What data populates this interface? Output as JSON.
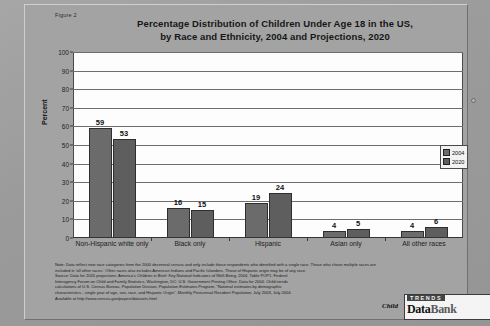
{
  "figure_label": "Figure 2",
  "legend": {
    "entries": [
      {
        "label": "2004",
        "color": "#6b6b6b"
      },
      {
        "label": "2020",
        "color": "#5e5e5e"
      }
    ]
  },
  "logo": {
    "child": "Child",
    "trends": "TRENDS",
    "data": "Data",
    "bank": "Bank"
  },
  "notes": {
    "line1": "Note: Data reflect new race categories from the 2000 decennial census and only include those respondents who identified with a single race.  Those who chose multiple races are",
    "line2": "included in 'all other races.'  Other races also includes American Indians and Pacific Islanders.  Those of Hispanic origin may be of any race.",
    "line3": "Source: Data for 2020 projections:  America's Children in Brief: Key National Indicators of Well-Being, 2004, Table POP1.  Federal",
    "line4": "Interagency Forum on Child and Family Statistics, Washington, DC: U.S. Government Printing Office.  Data for 2004:  Child trends",
    "line5": "calculations of U.S. Census Bureau, Population Division, Population Estimates Program, \"National estimates by demographic",
    "line6": "characteristics - single year of age, sex, race, and Hispanic Origin\", Monthly Postcensal Resident Population, July 2003, July 2004.",
    "line7": "Available at http://www.census.gov/popest/datasets.html"
  },
  "chart_data": {
    "type": "bar",
    "title": "Percentage Distribution of Children Under Age 18 in the US, by Race and Ethnicity, 2004 and Projections, 2020",
    "title_line1": "Percentage Distribution of Children Under Age 18 in the US,",
    "title_line2": "by Race and Ethnicity, 2004 and Projections, 2020",
    "xlabel": "",
    "ylabel": "Percent",
    "ylim": [
      0,
      100
    ],
    "yticks": [
      0,
      10,
      20,
      30,
      40,
      50,
      60,
      70,
      80,
      90,
      100
    ],
    "grid": true,
    "legend_position": "top-right-outside",
    "categories": [
      "Non-Hispanic white only",
      "Black only",
      "Hispanic",
      "Asian only",
      "All other races"
    ],
    "series": [
      {
        "name": "2004",
        "color": "#6b6b6b",
        "values": [
          59,
          16,
          19,
          4,
          4
        ]
      },
      {
        "name": "2020",
        "color": "#5e5e5e",
        "values": [
          53,
          15,
          24,
          5,
          6
        ]
      }
    ]
  }
}
